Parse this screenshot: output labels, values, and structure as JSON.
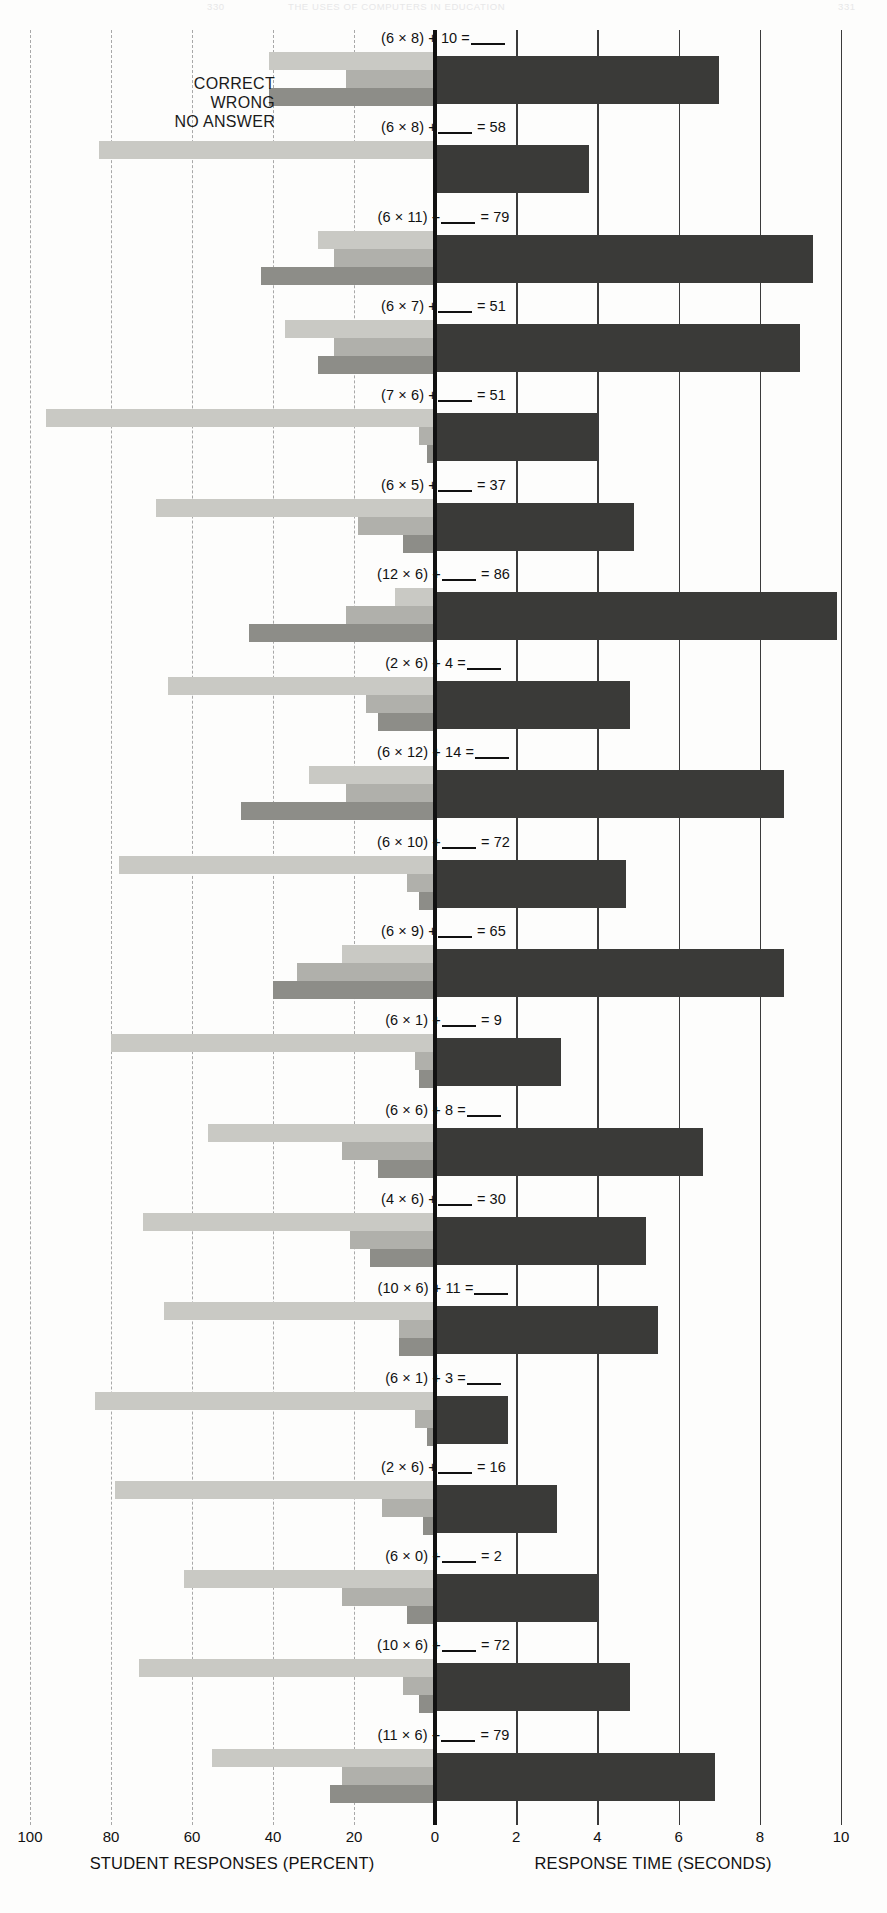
{
  "running_head": {
    "left": "330",
    "center": "THE USES OF COMPUTERS IN EDUCATION",
    "right": "331"
  },
  "legend": {
    "correct": "CORRECT",
    "wrong": "WRONG",
    "no_answer": "NO ANSWER"
  },
  "axes": {
    "left_title": "STUDENT RESPONSES (PERCENT)",
    "right_title": "RESPONSE TIME (SECONDS)",
    "left_ticks": [
      "100",
      "80",
      "60",
      "40",
      "20",
      "0"
    ],
    "right_ticks": [
      "2",
      "4",
      "6",
      "8",
      "10"
    ]
  },
  "chart_data": {
    "type": "bar",
    "title": "",
    "subtype": "paired diverging grouped horizontal bar chart",
    "xlabel_left": "STUDENT RESPONSES (PERCENT)",
    "xlabel_right": "RESPONSE TIME (SECONDS)",
    "ylabel": "",
    "grid": true,
    "legend": [
      "CORRECT",
      "WRONG",
      "NO ANSWER"
    ],
    "legend_position": "top-left inside plot",
    "left_axis": {
      "range": [
        100,
        0
      ],
      "direction": "right-to-left",
      "ticks": [
        100,
        80,
        60,
        40,
        20,
        0
      ],
      "unit": "percent"
    },
    "right_axis": {
      "range": [
        0,
        10
      ],
      "direction": "left-to-right",
      "ticks": [
        0,
        2,
        4,
        6,
        8,
        10
      ],
      "unit": "seconds"
    },
    "categories": [
      "(6 × 8) + 10 = ___",
      "(6 × 8) + ___ = 58",
      "(6 × 11) + ___ = 79",
      "(6 × 7) + ___ = 51",
      "(7 × 6) + ___ = 51",
      "(6 × 5) + ___ = 37",
      "(12 × 6) + ___ = 86",
      "(2 × 6) + 4 = ___",
      "(6 × 12) + 14 = ___",
      "(6 × 10) + ___ = 72",
      "(6 × 9) + ___ = 65",
      "(6 × 1) + ___ = 9",
      "(6 × 6) + 8 = ___",
      "(4 × 6) + ___ = 30",
      "(10 × 6) + 11 = ___",
      "(6 × 1) + 3 = ___",
      "(2 × 6) + ___ = 16",
      "(6 × 0) + ___ = 2",
      "(10 × 6) + ___ = 72",
      "(11 × 6) + ___ = 79"
    ],
    "series": [
      {
        "name": "CORRECT",
        "unit": "percent",
        "color": "#c9c9c4",
        "values": [
          41,
          83,
          29,
          37,
          96,
          69,
          10,
          66,
          31,
          78,
          23,
          80,
          56,
          72,
          67,
          84,
          79,
          62,
          73,
          55
        ]
      },
      {
        "name": "WRONG",
        "unit": "percent",
        "color": "#b0b0ab",
        "values": [
          22,
          0,
          25,
          25,
          4,
          19,
          22,
          17,
          22,
          7,
          34,
          5,
          23,
          21,
          9,
          5,
          13,
          23,
          8,
          23
        ]
      },
      {
        "name": "NO ANSWER",
        "unit": "percent",
        "color": "#8d8d88",
        "values": [
          41,
          0,
          43,
          29,
          2,
          8,
          46,
          14,
          48,
          4,
          40,
          4,
          14,
          16,
          9,
          2,
          3,
          7,
          4,
          26
        ]
      },
      {
        "name": "RESPONSE TIME",
        "unit": "seconds",
        "color": "#3a3a38",
        "values": [
          7.0,
          3.8,
          9.3,
          9.0,
          4.0,
          4.9,
          9.9,
          4.8,
          8.6,
          4.7,
          8.6,
          3.1,
          6.6,
          5.2,
          5.5,
          1.8,
          3.0,
          4.0,
          4.8,
          6.9
        ]
      }
    ],
    "labels_parsed": [
      {
        "expr": "(6 × 8) + 10 =",
        "blank": "right"
      },
      {
        "expr": "(6 × 8) +",
        "blank": "middle",
        "tail": "= 58"
      },
      {
        "expr": "(6 × 11) +",
        "blank": "middle",
        "tail": "= 79"
      },
      {
        "expr": "(6 × 7) +",
        "blank": "middle",
        "tail": "= 51"
      },
      {
        "expr": "(7 × 6) +",
        "blank": "middle",
        "tail": "= 51"
      },
      {
        "expr": "(6 × 5) +",
        "blank": "middle",
        "tail": "= 37"
      },
      {
        "expr": "(12 × 6) +",
        "blank": "middle",
        "tail": "= 86"
      },
      {
        "expr": "(2 × 6) + 4 =",
        "blank": "right"
      },
      {
        "expr": "(6 × 12) + 14 =",
        "blank": "right"
      },
      {
        "expr": "(6 × 10) +",
        "blank": "middle",
        "tail": "= 72"
      },
      {
        "expr": "(6 × 9) +",
        "blank": "middle",
        "tail": "= 65"
      },
      {
        "expr": "(6 × 1) +",
        "blank": "middle",
        "tail": "= 9"
      },
      {
        "expr": "(6 × 6) + 8 =",
        "blank": "right"
      },
      {
        "expr": "(4 × 6) +",
        "blank": "middle",
        "tail": "= 30"
      },
      {
        "expr": "(10 × 6) + 11 =",
        "blank": "right"
      },
      {
        "expr": "(6 × 1) + 3 =",
        "blank": "right"
      },
      {
        "expr": "(2 × 6) +",
        "blank": "middle",
        "tail": "= 16"
      },
      {
        "expr": "(6 × 0) +",
        "blank": "middle",
        "tail": "= 2"
      },
      {
        "expr": "(10 × 6) +",
        "blank": "middle",
        "tail": "= 72"
      },
      {
        "expr": "(11 × 6) +",
        "blank": "middle",
        "tail": "= 79"
      }
    ]
  },
  "geometry": {
    "zero_x": 435,
    "px_per_percent": 4.05,
    "px_per_second": 40.6,
    "plot_top": 30,
    "row_height": 89.3
  }
}
